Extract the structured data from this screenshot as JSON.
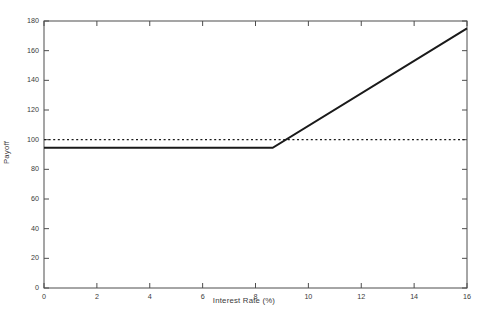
{
  "figure": {
    "background_color": "#ffffff",
    "axis_color": "#4d4d4d",
    "line_color": "#1a1a1a",
    "text_color": "#3a3a3a",
    "ghost_title": ""
  },
  "chart_data": {
    "type": "line",
    "title": "",
    "xlabel": "Interest Rate (%)",
    "ylabel": "Payoff",
    "xlim": [
      0,
      16
    ],
    "ylim": [
      0,
      180
    ],
    "xticks": [
      0,
      2,
      4,
      6,
      8,
      10,
      12,
      14,
      16
    ],
    "xticklabels": [
      "0",
      "2",
      "4",
      "6",
      "8",
      "10",
      "12",
      "14",
      "16"
    ],
    "yticks": [
      0,
      20,
      40,
      60,
      80,
      100,
      120,
      140,
      160,
      180
    ],
    "yticklabels": [
      "0",
      "20",
      "40",
      "60",
      "80",
      "100",
      "120",
      "140",
      "160",
      "180"
    ],
    "grid": false,
    "legend": null,
    "series": [
      {
        "name": "Payoff",
        "style": "solid",
        "linewidth": 2.0,
        "color": "#1a1a1a",
        "x": [
          0,
          8.65,
          16
        ],
        "y": [
          94.5,
          94.5,
          175
        ]
      },
      {
        "name": "Reference level",
        "style": "dotted",
        "linewidth": 1.2,
        "color": "#1a1a1a",
        "x": [
          0,
          16
        ],
        "y": [
          100,
          100
        ]
      }
    ],
    "annotations": [
      {
        "text": "kink at interest rate 8.65%, payoff 94.5"
      },
      {
        "text": "dotted reference payoff 100"
      }
    ]
  }
}
